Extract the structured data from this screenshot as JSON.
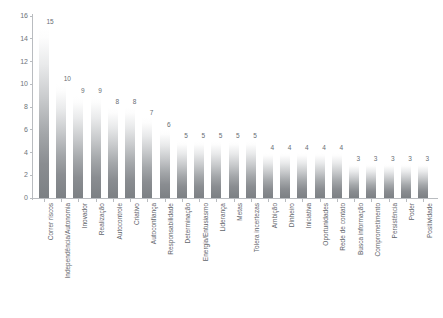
{
  "chart_data": {
    "type": "bar",
    "title": "",
    "subtitle": "",
    "xlabel": "",
    "ylabel": "",
    "ylim": [
      0,
      16
    ],
    "ytick_step": 2,
    "yticks": [
      0,
      2,
      4,
      6,
      8,
      10,
      12,
      14,
      16
    ],
    "grid": false,
    "legend": "none",
    "bar_orientation": "vertical",
    "bar_fill": "vertical-gradient-white-to-gray",
    "value_labels": true,
    "categories": [
      "Correr riscos",
      "Independência/Autonomia",
      "Inovador",
      "Realização",
      "Autocontrole",
      "Criativo",
      "Autoconfiança",
      "Responsabilidade",
      "Determinação",
      "Energia/Entusiasmo",
      "Liderança",
      "Metas",
      "Tolera incertezas",
      "Ambição",
      "Dinheiro",
      "Iniciativa",
      "Oportunidades",
      "Rede de contato",
      "Busca informação",
      "Comprometimento",
      "Persistência",
      "Poder",
      "Positividade"
    ],
    "values": [
      15,
      10,
      9,
      9,
      8,
      8,
      7,
      6,
      5,
      5,
      5,
      5,
      5,
      4,
      4,
      4,
      4,
      4,
      3,
      3,
      3,
      3,
      3
    ]
  },
  "colors": {
    "axis": "#b9bcc0",
    "tick_text": "#6e747a",
    "label_text": "#5f656b",
    "value_text": "#676d73",
    "bar_top": "#ffffff",
    "bar_bottom": "#7c8084",
    "background": "#ffffff"
  }
}
